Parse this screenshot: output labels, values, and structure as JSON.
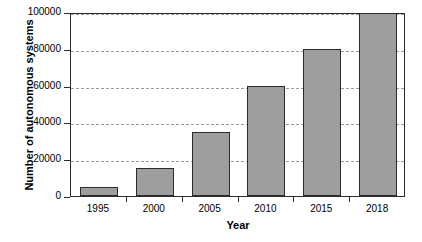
{
  "chart_data": {
    "type": "bar",
    "title": "",
    "xlabel": "Year",
    "ylabel": "Number of autonomous systems",
    "categories": [
      "1995",
      "2000",
      "2005",
      "2010",
      "2015",
      "2018"
    ],
    "values": [
      5000,
      15000,
      35000,
      60000,
      80000,
      100000
    ],
    "ylim": [
      0,
      100000
    ],
    "ytick_labels": [
      "0",
      "20000",
      "40000",
      "60000",
      "80000",
      "100000"
    ],
    "ytick_values": [
      0,
      20000,
      40000,
      60000,
      80000,
      100000
    ],
    "grid": "horizontal-dashed",
    "legend": "none",
    "bar_color": "#9e9e9e",
    "bar_border_color": "#2b2b2b",
    "gridline_color": "#9a9a9a",
    "axis_color": "#2b2b2b",
    "background": "#ffffff"
  }
}
